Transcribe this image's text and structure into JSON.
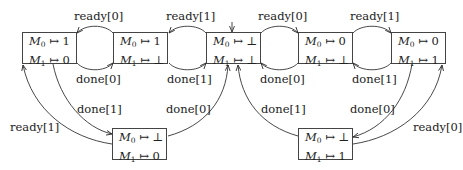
{
  "diagram": {
    "type": "state-transition",
    "states": [
      {
        "id": "s1",
        "m0_var": "M",
        "m0_idx": "0",
        "m0_val": "1",
        "m1_var": "M",
        "m1_idx": "1",
        "m1_val": "0",
        "arrow": "↦"
      },
      {
        "id": "s2",
        "m0_var": "M",
        "m0_idx": "0",
        "m0_val": "1",
        "m1_var": "M",
        "m1_idx": "1",
        "m1_val": "⊥",
        "arrow": "↦"
      },
      {
        "id": "s3",
        "m0_var": "M",
        "m0_idx": "0",
        "m0_val": "⊥",
        "m1_var": "M",
        "m1_idx": "1",
        "m1_val": "⊥",
        "arrow": "↦",
        "initial": true
      },
      {
        "id": "s4",
        "m0_var": "M",
        "m0_idx": "0",
        "m0_val": "0",
        "m1_var": "M",
        "m1_idx": "1",
        "m1_val": "⊥",
        "arrow": "↦"
      },
      {
        "id": "s5",
        "m0_var": "M",
        "m0_idx": "0",
        "m0_val": "0",
        "m1_var": "M",
        "m1_idx": "1",
        "m1_val": "1",
        "arrow": "↦"
      },
      {
        "id": "s6",
        "m0_var": "M",
        "m0_idx": "0",
        "m0_val": "⊥",
        "m1_var": "M",
        "m1_idx": "1",
        "m1_val": "0",
        "arrow": "↦"
      },
      {
        "id": "s7",
        "m0_var": "M",
        "m0_idx": "0",
        "m0_val": "⊥",
        "m1_var": "M",
        "m1_idx": "1",
        "m1_val": "1",
        "arrow": "↦"
      }
    ],
    "transitions": [
      {
        "from": "s2",
        "to": "s1",
        "label": "ready[0]"
      },
      {
        "from": "s1",
        "to": "s2",
        "label": "done[0]"
      },
      {
        "from": "s3",
        "to": "s2",
        "label": "ready[1]"
      },
      {
        "from": "s2",
        "to": "s3",
        "label": "done[1]"
      },
      {
        "from": "s3",
        "to": "s4",
        "label": "ready[0]"
      },
      {
        "from": "s4",
        "to": "s3",
        "label": "done[0]"
      },
      {
        "from": "s4",
        "to": "s5",
        "label": "ready[1]"
      },
      {
        "from": "s5",
        "to": "s4",
        "label": "done[1]"
      },
      {
        "from": "s1",
        "to": "s6",
        "label": "done[1]"
      },
      {
        "from": "s6",
        "to": "s1",
        "label": "ready[1]"
      },
      {
        "from": "s6",
        "to": "s3",
        "label": "done[0]"
      },
      {
        "from": "s7",
        "to": "s3",
        "label": "done[1]"
      },
      {
        "from": "s5",
        "to": "s7",
        "label": "done[0]"
      },
      {
        "from": "s7",
        "to": "s5",
        "label": "ready[0]"
      }
    ]
  }
}
